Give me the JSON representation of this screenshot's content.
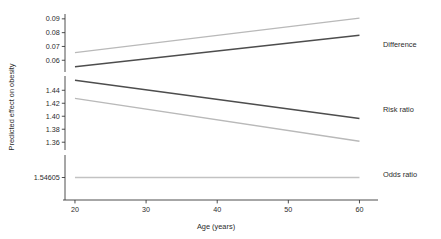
{
  "figure": {
    "background": "#ffffff",
    "axis_color": "#3a3a3a",
    "text_color": "#2b2b2b"
  },
  "chart_data": {
    "type": "line",
    "title": "",
    "subtitle": "",
    "xlabel": "Age (years)",
    "ylabel": "Predicted effect on obesity",
    "grid": false,
    "legend_position": "right-inline",
    "broken_axis": true,
    "x": [
      20,
      60
    ],
    "xlim": [
      18.6,
      61.2
    ],
    "xticks": [
      20,
      30,
      40,
      50,
      60
    ],
    "xticklabels": [
      "20",
      "30",
      "40",
      "50",
      "60"
    ],
    "y_panels": [
      {
        "name": "difference-scale",
        "ylim": [
          0.0515,
          0.0935
        ],
        "ticks": [
          0.09,
          0.08,
          0.07,
          0.06
        ],
        "ticklabels": [
          "0.09",
          "0.08",
          "0.07",
          "0.06"
        ],
        "px_top": 14.0,
        "px_bottom": 72.0
      },
      {
        "name": "risk-ratio-scale",
        "ylim": [
          1.348,
          1.462
        ],
        "ticks": [
          1.44,
          1.42,
          1.4,
          1.38,
          1.36
        ],
        "ticklabels": [
          "1.44",
          "1.42",
          "1.40",
          "1.38",
          "1.36"
        ],
        "px_top": 76.0,
        "px_bottom": 150.0
      },
      {
        "name": "odds-ratio-scale",
        "ylim": [
          1.5455,
          1.5466
        ],
        "ticks": [
          1.54605
        ],
        "ticklabels": [
          "1.54605"
        ],
        "px_top": 155.0,
        "px_bottom": 200.0
      }
    ],
    "series": [
      {
        "name": "Difference upper bound",
        "panel": "difference-scale",
        "color": "#b9b9b9",
        "width": 1.3,
        "label": "",
        "points": [
          [
            20,
            0.0655
          ],
          [
            60,
            0.0905
          ]
        ]
      },
      {
        "name": "Difference",
        "panel": "difference-scale",
        "color": "#4d4d4d",
        "width": 1.5,
        "label": "Difference",
        "label_x": 62.5,
        "points": [
          [
            20,
            0.0553
          ],
          [
            60,
            0.0782
          ]
        ]
      },
      {
        "name": "Risk ratio",
        "panel": "risk-ratio-scale",
        "color": "#4d4d4d",
        "width": 1.5,
        "label": "Risk ratio",
        "label_x": 62.5,
        "points": [
          [
            20,
            1.4555
          ],
          [
            60,
            1.3965
          ]
        ]
      },
      {
        "name": "Risk ratio lower bound",
        "panel": "risk-ratio-scale",
        "color": "#b9b9b9",
        "width": 1.3,
        "label": "",
        "points": [
          [
            20,
            1.4275
          ],
          [
            60,
            1.3615
          ]
        ]
      },
      {
        "name": "Odds ratio",
        "panel": "odds-ratio-scale",
        "color": "#c2c2c2",
        "width": 1.6,
        "label": "Odds ratio",
        "label_x": 62.5,
        "points": [
          [
            20,
            1.54605
          ],
          [
            60,
            1.54605
          ]
        ]
      }
    ],
    "series_labels": [
      {
        "text": "Difference",
        "px_x": 383,
        "px_y": 47
      },
      {
        "text": "Risk ratio",
        "px_x": 383,
        "px_y": 112
      },
      {
        "text": "Odds ratio",
        "px_x": 383,
        "px_y": 177
      }
    ]
  }
}
